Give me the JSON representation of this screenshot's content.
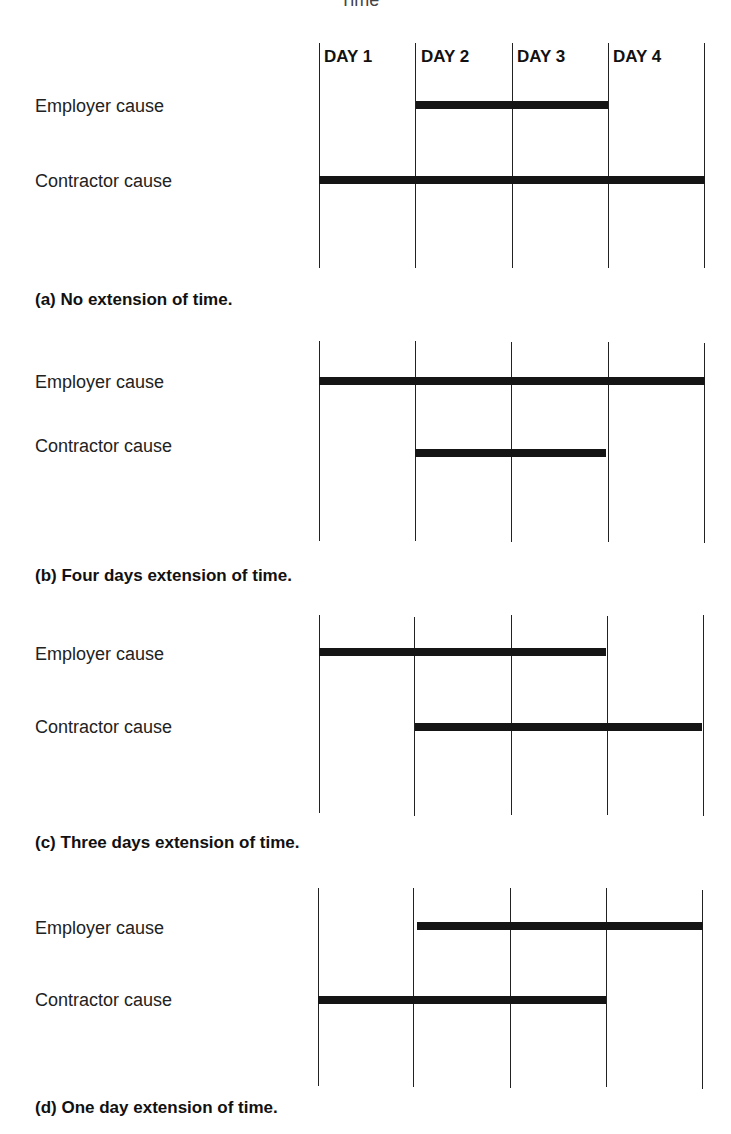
{
  "header": {
    "cut_text": "Time",
    "days": [
      "DAY 1",
      "DAY 2",
      "DAY 3",
      "DAY 4"
    ]
  },
  "row_labels": {
    "employer": "Employer cause",
    "contractor": "Contractor cause"
  },
  "panels": [
    {
      "id": "a",
      "caption": "(a) No extension of time.",
      "employer_span": [
        2,
        3
      ],
      "contractor_span": [
        1,
        4
      ]
    },
    {
      "id": "b",
      "caption": "(b) Four days extension of time.",
      "employer_span": [
        1,
        4
      ],
      "contractor_span": [
        2,
        3
      ]
    },
    {
      "id": "c",
      "caption": "(c) Three days extension of time.",
      "employer_span": [
        1,
        3
      ],
      "contractor_span": [
        2,
        4
      ]
    },
    {
      "id": "d",
      "caption": "(d) One day extension of time.",
      "employer_span": [
        2,
        4
      ],
      "contractor_span": [
        1,
        3
      ]
    }
  ],
  "colors": {
    "bar": "#151515",
    "grid": "#222222",
    "background": "#ffffff"
  }
}
